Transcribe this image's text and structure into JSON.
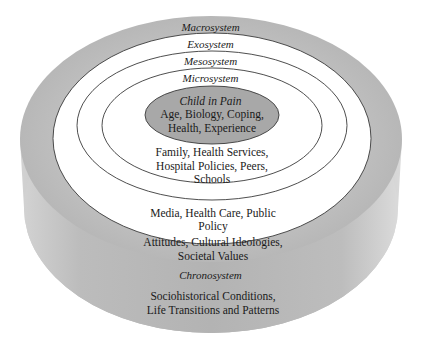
{
  "diagram": {
    "type": "nested-ellipses-cylinder",
    "colors": {
      "grey_top": "#b9b9b9",
      "grey_side": "#a9a9a9",
      "white": "#ffffff",
      "outline": "#3a3a3a",
      "core_fill": "#a8a8a8"
    },
    "layers": {
      "macrosystem": {
        "title": "Macrosystem",
        "body": "Attitudes, Cultural Ideologies, Societal Values"
      },
      "exosystem": {
        "title": "Exosystem",
        "body": "Media, Health Care, Public Policy"
      },
      "mesosystem": {
        "title": "Mesosystem"
      },
      "microsystem": {
        "title": "Microsystem",
        "body": "Family, Health Services, Hospital Policies, Peers, Schools"
      },
      "core": {
        "title": "Child in Pain",
        "body": "Age, Biology, Coping, Health, Experience"
      },
      "chronosystem": {
        "title": "Chronosystem",
        "body": "Sociohistorical Conditions, Life Transitions and Patterns"
      }
    }
  }
}
